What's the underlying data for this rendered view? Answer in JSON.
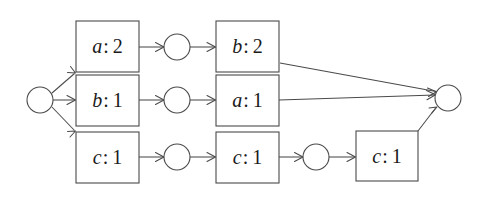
{
  "diagram": {
    "type": "directed-graph",
    "background_color": "#ffffff",
    "stroke_color": "#4a4a4a",
    "text_color": "#1a1a1a",
    "nodes": {
      "source": {
        "id": "source",
        "shape": "circle",
        "label": "",
        "cx": 40,
        "cy": 100,
        "r": 13
      },
      "circle_top": {
        "id": "circle_top",
        "shape": "circle",
        "label": "",
        "cx": 177,
        "cy": 47,
        "r": 13
      },
      "circle_mid": {
        "id": "circle_mid",
        "shape": "circle",
        "label": "",
        "cx": 177,
        "cy": 100,
        "r": 13
      },
      "circle_bot": {
        "id": "circle_bot",
        "shape": "circle",
        "label": "",
        "cx": 177,
        "cy": 157,
        "r": 13
      },
      "circle_bot2": {
        "id": "circle_bot2",
        "shape": "circle",
        "label": "",
        "cx": 316,
        "cy": 157,
        "r": 13
      },
      "sink": {
        "id": "sink",
        "shape": "circle",
        "label": "",
        "cx": 448,
        "cy": 98,
        "r": 13
      }
    },
    "boxes": [
      {
        "id": "box_a2",
        "var": "a",
        "sep": ":",
        "count": "2",
        "text": "a: 2",
        "x": 76,
        "y": 21,
        "w": 63,
        "h": 51
      },
      {
        "id": "box_b1",
        "var": "b",
        "sep": ":",
        "count": "1",
        "text": "b: 1",
        "x": 76,
        "y": 75,
        "w": 63,
        "h": 51
      },
      {
        "id": "box_c1_left",
        "var": "c",
        "sep": ":",
        "count": "1",
        "text": "c: 1",
        "x": 76,
        "y": 132,
        "w": 63,
        "h": 51
      },
      {
        "id": "box_b2",
        "var": "b",
        "sep": ":",
        "count": "2",
        "text": "b: 2",
        "x": 216,
        "y": 21,
        "w": 63,
        "h": 51
      },
      {
        "id": "box_a1",
        "var": "a",
        "sep": ":",
        "count": "1",
        "text": "a: 1",
        "x": 216,
        "y": 75,
        "w": 63,
        "h": 51
      },
      {
        "id": "box_c1_mid",
        "var": "c",
        "sep": ":",
        "count": "1",
        "text": "c: 1",
        "x": 216,
        "y": 132,
        "w": 63,
        "h": 51
      },
      {
        "id": "box_c1_right",
        "var": "c",
        "sep": ":",
        "count": "1",
        "text": "c: 1",
        "x": 356,
        "y": 131,
        "w": 62,
        "h": 50
      }
    ],
    "edges": [
      {
        "id": "e_source_a2",
        "from": "source",
        "to": "box_a2",
        "x1": 53,
        "y1": 94,
        "x2": 75,
        "y2": 73
      },
      {
        "id": "e_source_b1",
        "from": "source",
        "to": "box_b1",
        "x1": 53,
        "y1": 100,
        "x2": 75,
        "y2": 100
      },
      {
        "id": "e_source_c1",
        "from": "source",
        "to": "box_c1_left",
        "x1": 53,
        "y1": 106,
        "x2": 75,
        "y2": 131
      },
      {
        "id": "e_a2_circle",
        "from": "box_a2",
        "to": "circle_top",
        "x1": 139,
        "y1": 47,
        "x2": 164,
        "y2": 47
      },
      {
        "id": "e_circle_b2",
        "from": "circle_top",
        "to": "box_b2",
        "x1": 190,
        "y1": 47,
        "x2": 215,
        "y2": 47
      },
      {
        "id": "e_b1_circle",
        "from": "box_b1",
        "to": "circle_mid",
        "x1": 139,
        "y1": 100,
        "x2": 164,
        "y2": 100
      },
      {
        "id": "e_circle_a1",
        "from": "circle_mid",
        "to": "box_a1",
        "x1": 190,
        "y1": 100,
        "x2": 215,
        "y2": 100
      },
      {
        "id": "e_c1_circle",
        "from": "box_c1_left",
        "to": "circle_bot",
        "x1": 139,
        "y1": 157,
        "x2": 164,
        "y2": 157
      },
      {
        "id": "e_circle_c1mid",
        "from": "circle_bot",
        "to": "box_c1_mid",
        "x1": 190,
        "y1": 157,
        "x2": 215,
        "y2": 157
      },
      {
        "id": "e_c1mid_circle2",
        "from": "box_c1_mid",
        "to": "circle_bot2",
        "x1": 279,
        "y1": 157,
        "x2": 303,
        "y2": 157
      },
      {
        "id": "e_circle2_c1right",
        "from": "circle_bot2",
        "to": "box_c1_right",
        "x1": 329,
        "y1": 157,
        "x2": 355,
        "y2": 157
      },
      {
        "id": "e_b2_sink",
        "from": "box_b2",
        "to": "sink",
        "x1": 280,
        "y1": 63,
        "x2": 436,
        "y2": 91
      },
      {
        "id": "e_a1_sink",
        "from": "box_a1",
        "to": "sink",
        "x1": 279,
        "y1": 100,
        "x2": 435,
        "y2": 95
      },
      {
        "id": "e_c1right_sink",
        "from": "box_c1_right",
        "to": "sink",
        "x1": 418,
        "y1": 131,
        "x2": 437,
        "y2": 107
      }
    ]
  }
}
